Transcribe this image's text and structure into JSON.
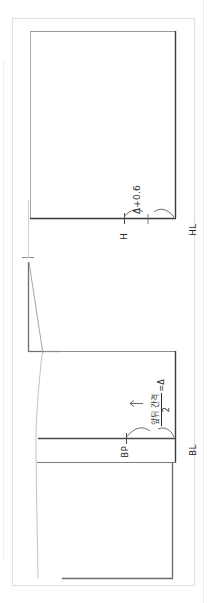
{
  "diagram": {
    "labels": {
      "hl": "HL",
      "h": "H",
      "delta_offset": "Δ+0.6",
      "bl": "BL",
      "bp": "BP"
    },
    "formula": {
      "numerator": "앞뒤 간격",
      "denominator": "2",
      "equals": "=Δ"
    },
    "colors": {
      "line_dark": "#3a3a3a",
      "line_mid": "#6f6f6f",
      "line_light": "#b9b9b9",
      "line_faint": "#dcdcdc",
      "text": "#2b2b2b",
      "background": "#ffffff"
    },
    "geometry": {
      "canvas_width": 207,
      "canvas_height": 603,
      "outer_border": {
        "x": 12,
        "y": 18,
        "w": 183,
        "h": 568
      },
      "upper_panel": {
        "x": 30,
        "y": 31,
        "w": 146,
        "h": 187
      },
      "hip_line_y": 218,
      "bust_line_y": 438,
      "lower_panel_bottom_y": 463,
      "hem_line_y": 578
    }
  }
}
